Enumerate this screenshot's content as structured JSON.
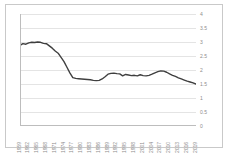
{
  "chart_data": {
    "type": "line",
    "title": "",
    "subtitle": "",
    "xlabel": "",
    "ylabel": "",
    "ylim": [
      0,
      4
    ],
    "yticks": [
      "0",
      "0.5",
      "1",
      "1.5",
      "2",
      "2.5",
      "3",
      "3.5",
      "4"
    ],
    "ytick_values": [
      0,
      0.5,
      1,
      1.5,
      2,
      2.5,
      3,
      3.5,
      4
    ],
    "grid": true,
    "legend_position": "none",
    "line_color": "#3f3f3f",
    "gridline_color": "#e4e4e4",
    "axis_label_color": "#8d8d8d",
    "xtick_labels": [
      "1959",
      "1962",
      "1965",
      "1968",
      "1971",
      "1974",
      "1977",
      "1980",
      "1983",
      "1986",
      "1989",
      "1992",
      "1995",
      "1998",
      "2001",
      "2004",
      "2007",
      "2010",
      "2013",
      "2016",
      "2019"
    ],
    "x": [
      1959,
      1960,
      1961,
      1962,
      1963,
      1964,
      1965,
      1966,
      1967,
      1968,
      1969,
      1970,
      1971,
      1972,
      1973,
      1974,
      1975,
      1976,
      1977,
      1978,
      1979,
      1980,
      1981,
      1982,
      1983,
      1984,
      1985,
      1986,
      1987,
      1988,
      1989,
      1990,
      1991,
      1992,
      1993,
      1994,
      1995,
      1996,
      1997,
      1998,
      1999,
      2000,
      2001,
      2002,
      2003,
      2004,
      2005,
      2006,
      2007,
      2008,
      2009,
      2010,
      2011,
      2012,
      2013,
      2014,
      2015,
      2016,
      2017,
      2018,
      2019
    ],
    "values": [
      2.88,
      2.94,
      2.92,
      2.97,
      2.99,
      2.98,
      3.0,
      2.99,
      2.95,
      2.94,
      2.86,
      2.78,
      2.68,
      2.6,
      2.45,
      2.3,
      2.1,
      1.9,
      1.73,
      1.7,
      1.69,
      1.68,
      1.67,
      1.66,
      1.65,
      1.63,
      1.62,
      1.63,
      1.68,
      1.76,
      1.85,
      1.88,
      1.89,
      1.87,
      1.86,
      1.79,
      1.84,
      1.82,
      1.8,
      1.81,
      1.79,
      1.83,
      1.8,
      1.79,
      1.81,
      1.85,
      1.9,
      1.94,
      1.97,
      1.96,
      1.92,
      1.86,
      1.81,
      1.77,
      1.72,
      1.68,
      1.64,
      1.6,
      1.57,
      1.54,
      1.5
    ]
  }
}
